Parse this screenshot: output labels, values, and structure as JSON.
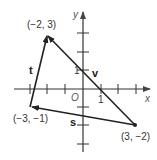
{
  "diagram": {
    "axes": {
      "x_label": "x",
      "y_label": "y",
      "origin_label": "O",
      "x_tick_label": "1",
      "y_tick_label": "1",
      "x_range": [
        -3,
        3
      ],
      "y_range": [
        -3,
        3
      ]
    },
    "points": [
      {
        "id": "A",
        "label": "(−2, 3)",
        "x": -2,
        "y": 3
      },
      {
        "id": "B",
        "label": "(−3, −1)",
        "x": -3,
        "y": -1
      },
      {
        "id": "C",
        "label": "(3, −2)",
        "x": 3,
        "y": -2
      }
    ],
    "vectors": [
      {
        "name": "t",
        "from": "B",
        "to": "A"
      },
      {
        "name": "v",
        "from": "C",
        "to": "A"
      },
      {
        "name": "s",
        "from": "C",
        "to": "B"
      }
    ],
    "colors": {
      "line": "#222222",
      "axis": "#333333",
      "text": "#333333"
    }
  }
}
